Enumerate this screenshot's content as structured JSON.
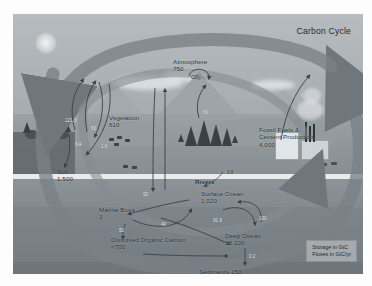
{
  "figure": {
    "title": "Carbon Cycle",
    "legend": "Storage in GtC\nFluxes in GtC/yr"
  },
  "reservoirs": [
    {
      "name": "atmosphere",
      "label": "Atmosphere\n750",
      "value": "750",
      "molecule": "CO2"
    },
    {
      "name": "vegetation",
      "label": "Vegetation\n610",
      "value": "610"
    },
    {
      "name": "soil",
      "label": "Soil\n1,500",
      "value": "1,500"
    },
    {
      "name": "fossil-fuels",
      "label": "Fossil Fuels &\nCement Production\n4,000",
      "value": "4,000"
    },
    {
      "name": "surface-ocean",
      "label": "Surface Ocean\n1,020",
      "value": "1,020"
    },
    {
      "name": "marine-biota",
      "label": "Marine Biota\n3",
      "value": "3"
    },
    {
      "name": "dissolved-organic-carbon",
      "label": "Dissolved Organic Carbon\n<700",
      "value": "<700"
    },
    {
      "name": "deep-ocean",
      "label": "Deep Ocean\n38,100",
      "value": "38,100"
    },
    {
      "name": "sediments",
      "label": "Sediments 150",
      "value": "150"
    }
  ],
  "flow_labels": {
    "rivers": "Rivers",
    "fossil_emissions": "5.5",
    "photosynthesis": "121.3",
    "respiration": "60",
    "soil_respiration": "60",
    "land_sink": "1.6",
    "ocean_uptake": "92",
    "ocean_outgas": "90",
    "biota_flux": "50",
    "doc_flux": "40",
    "deep_mix_down": "91.6",
    "deep_mix_up": "100",
    "sediment_flux": "0.2",
    "river_flux": "0.8",
    "land_use": "6.4"
  },
  "chart_data": {
    "type": "diagram",
    "title": "Carbon Cycle",
    "units": {
      "storage": "GtC",
      "flux": "GtC/yr"
    },
    "reservoirs": [
      {
        "name": "Atmosphere",
        "storage": 750
      },
      {
        "name": "Vegetation",
        "storage": 610
      },
      {
        "name": "Soil",
        "storage": 1500
      },
      {
        "name": "Fossil Fuels & Cement Production",
        "storage": 4000
      },
      {
        "name": "Surface Ocean",
        "storage": 1020
      },
      {
        "name": "Marine Biota",
        "storage": 3
      },
      {
        "name": "Dissolved Organic Carbon",
        "storage": "<700"
      },
      {
        "name": "Deep Ocean",
        "storage": 38100
      },
      {
        "name": "Sediments",
        "storage": 150
      }
    ],
    "fluxes": [
      {
        "from": "Fossil Fuels & Cement Production",
        "to": "Atmosphere",
        "value": 5.5
      },
      {
        "from": "Atmosphere",
        "to": "Vegetation",
        "value": 121.3
      },
      {
        "from": "Vegetation",
        "to": "Atmosphere",
        "value": 60
      },
      {
        "from": "Soil",
        "to": "Atmosphere",
        "value": 60
      },
      {
        "from": "Atmosphere",
        "to": "Surface Ocean",
        "value": 92
      },
      {
        "from": "Surface Ocean",
        "to": "Atmosphere",
        "value": 90
      },
      {
        "from": "Surface Ocean",
        "to": "Marine Biota",
        "value": 50
      },
      {
        "from": "Marine Biota",
        "to": "Dissolved Organic Carbon",
        "value": 40
      },
      {
        "from": "Surface Ocean",
        "to": "Deep Ocean",
        "value": 91.6
      },
      {
        "from": "Deep Ocean",
        "to": "Surface Ocean",
        "value": 100
      },
      {
        "from": "Deep Ocean",
        "to": "Sediments",
        "value": 0.2
      },
      {
        "from": "Rivers",
        "to": "Surface Ocean",
        "value": 0.8
      }
    ]
  }
}
